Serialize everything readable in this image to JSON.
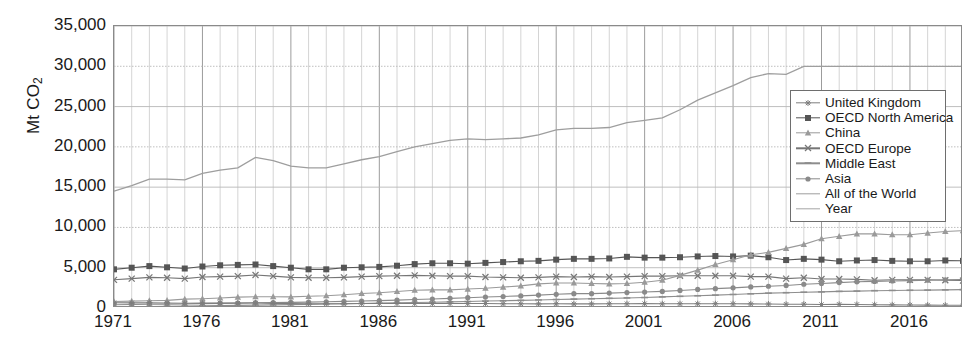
{
  "axes": {
    "y_axis_label": "Mt CO2",
    "y_axis_label_main": "Mt CO",
    "y_axis_label_sub": "2",
    "y_ticks": [
      "0",
      "5,000",
      "10,000",
      "15,000",
      "20,000",
      "25,000",
      "30,000",
      "35,000"
    ],
    "x_ticks": [
      "1971",
      "1976",
      "1981",
      "1986",
      "1991",
      "1996",
      "2001",
      "2006",
      "2011",
      "2016"
    ]
  },
  "legend": {
    "items": [
      {
        "label": "United Kingdom",
        "color": "#7e7e7e",
        "marker": "star-icon"
      },
      {
        "label": "OECD North America",
        "color": "#555555",
        "marker": "square-icon"
      },
      {
        "label": "China",
        "color": "#9a9a9a",
        "marker": "triangle-icon"
      },
      {
        "label": "OECD Europe",
        "color": "#767676",
        "marker": "cross-icon"
      },
      {
        "label": "Middle East",
        "color": "#8d8d8d",
        "marker": "dash-icon"
      },
      {
        "label": "Asia",
        "color": "#8a8a8a",
        "marker": "circle-icon"
      },
      {
        "label": "All of the World",
        "color": "#9e9e9e",
        "marker": "line-icon"
      },
      {
        "label": "Year",
        "color": "#a5a5a5",
        "marker": "line-icon"
      }
    ]
  },
  "chart_data": {
    "type": "line",
    "title": "",
    "xlabel": "",
    "ylabel": "Mt CO2",
    "xlim": [
      1971,
      2019
    ],
    "ylim": [
      0,
      35000
    ],
    "ytick_step": 5000,
    "grid": true,
    "grid_x_step": 1,
    "legend_position": "top-right-inside",
    "x": [
      1971,
      1972,
      1973,
      1974,
      1975,
      1976,
      1977,
      1978,
      1979,
      1980,
      1981,
      1982,
      1983,
      1984,
      1985,
      1986,
      1987,
      1988,
      1989,
      1990,
      1991,
      1992,
      1993,
      1994,
      1995,
      1996,
      1997,
      1998,
      1999,
      2000,
      2001,
      2002,
      2003,
      2004,
      2005,
      2006,
      2007,
      2008,
      2009,
      2010,
      2011,
      2012,
      2013,
      2014,
      2015,
      2016,
      2017,
      2018,
      2019
    ],
    "series": [
      {
        "name": "All of the World",
        "color": "#9e9e9e",
        "marker": "none",
        "values": [
          14500,
          15200,
          16000,
          16000,
          15900,
          16700,
          17100,
          17400,
          18700,
          18300,
          17600,
          17400,
          17400,
          17900,
          18400,
          18800,
          19400,
          20000,
          20400,
          20800,
          21000,
          20900,
          21000,
          21100,
          21500,
          22100,
          22300,
          22300,
          22400,
          23000,
          23300,
          23600,
          24600,
          25800,
          26700,
          27600,
          28600,
          29100,
          29000,
          30000,
          30000,
          30000,
          30000,
          30000,
          30000,
          30000,
          30000,
          30000,
          30000
        ]
      },
      {
        "name": "OECD North America",
        "color": "#555555",
        "marker": "square",
        "values": [
          4800,
          5000,
          5200,
          5050,
          4900,
          5150,
          5300,
          5350,
          5400,
          5200,
          5000,
          4800,
          4800,
          5000,
          5050,
          5100,
          5250,
          5450,
          5550,
          5550,
          5500,
          5600,
          5700,
          5800,
          5850,
          6000,
          6100,
          6100,
          6150,
          6350,
          6250,
          6250,
          6300,
          6400,
          6450,
          6400,
          6500,
          6300,
          5950,
          6100,
          6000,
          5800,
          5900,
          5950,
          5850,
          5800,
          5800,
          5900,
          5850
        ]
      },
      {
        "name": "OECD Europe",
        "color": "#767676",
        "marker": "cross",
        "values": [
          3500,
          3650,
          3800,
          3750,
          3650,
          3850,
          3900,
          3950,
          4100,
          3950,
          3800,
          3750,
          3750,
          3800,
          3900,
          3950,
          4000,
          4050,
          4000,
          3950,
          3950,
          3850,
          3800,
          3750,
          3800,
          3900,
          3850,
          3900,
          3850,
          3900,
          3950,
          3950,
          4000,
          4000,
          4000,
          4000,
          3900,
          3900,
          3650,
          3750,
          3600,
          3600,
          3550,
          3450,
          3500,
          3500,
          3500,
          3450,
          3400
        ]
      },
      {
        "name": "China",
        "color": "#9a9a9a",
        "marker": "triangle",
        "values": [
          800,
          850,
          900,
          950,
          1100,
          1150,
          1250,
          1350,
          1400,
          1400,
          1380,
          1450,
          1520,
          1650,
          1800,
          1900,
          2050,
          2200,
          2250,
          2250,
          2350,
          2450,
          2600,
          2750,
          3000,
          3100,
          3100,
          3050,
          3000,
          3050,
          3200,
          3450,
          4050,
          4700,
          5400,
          6000,
          6600,
          6900,
          7400,
          7900,
          8600,
          8900,
          9200,
          9200,
          9100,
          9100,
          9300,
          9500,
          9600
        ]
      },
      {
        "name": "Asia",
        "color": "#8a8a8a",
        "marker": "circle",
        "values": [
          400,
          430,
          470,
          480,
          500,
          540,
          580,
          620,
          660,
          680,
          700,
          730,
          770,
          820,
          870,
          920,
          980,
          1050,
          1120,
          1200,
          1280,
          1360,
          1430,
          1500,
          1600,
          1700,
          1780,
          1780,
          1850,
          1920,
          1980,
          2060,
          2180,
          2300,
          2400,
          2500,
          2620,
          2700,
          2800,
          2950,
          3050,
          3150,
          3250,
          3300,
          3350,
          3400,
          3450,
          3500,
          3550
        ]
      },
      {
        "name": "Middle East",
        "color": "#8d8d8d",
        "marker": "dash",
        "values": [
          150,
          170,
          190,
          210,
          240,
          270,
          300,
          330,
          360,
          390,
          420,
          450,
          490,
          520,
          560,
          600,
          640,
          680,
          720,
          760,
          800,
          860,
          900,
          950,
          1000,
          1050,
          1100,
          1150,
          1200,
          1250,
          1300,
          1380,
          1450,
          1520,
          1600,
          1680,
          1760,
          1840,
          1900,
          1960,
          2000,
          2060,
          2100,
          2150,
          2180,
          2200,
          2220,
          2250,
          2280
        ]
      },
      {
        "name": "United Kingdom",
        "color": "#7e7e7e",
        "marker": "star",
        "values": [
          650,
          640,
          660,
          620,
          590,
          600,
          600,
          600,
          620,
          580,
          550,
          530,
          530,
          520,
          550,
          560,
          560,
          560,
          560,
          560,
          560,
          550,
          530,
          520,
          510,
          530,
          510,
          510,
          520,
          530,
          540,
          520,
          530,
          530,
          530,
          530,
          510,
          500,
          460,
          470,
          430,
          450,
          440,
          410,
          390,
          370,
          360,
          350,
          340
        ]
      }
    ]
  }
}
